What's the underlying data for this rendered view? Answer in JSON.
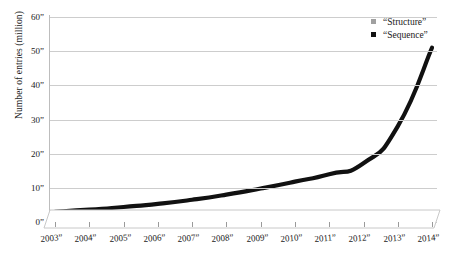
{
  "chart_data": {
    "type": "line",
    "title": "",
    "xlabel": "",
    "ylabel": "Number of entries (million)",
    "categories": [
      "2003”",
      "2004”",
      "2005”",
      "2006”",
      "2007”",
      "2008”",
      "2009”",
      "2010”",
      "2011”",
      "2012”",
      "2013”",
      "2014”"
    ],
    "x_tick_labels": [
      "2003”",
      "2004”",
      "2005”",
      "2006”",
      "2007”",
      "2008”",
      "2009”",
      "2010”",
      "2011”",
      "2012”",
      "2013”",
      "2014”"
    ],
    "y_tick_labels": [
      "0”",
      "10”",
      "20”",
      "30”",
      "40”",
      "50”",
      "60”"
    ],
    "y_tick_values": [
      0,
      10,
      20,
      30,
      40,
      50,
      60
    ],
    "ylim": [
      0,
      60
    ],
    "grid": "horizontal",
    "legend_position": "top-right",
    "series": [
      {
        "name": "“Structure”",
        "color": "#a0a0a0",
        "values": [
          0.1,
          0.12,
          0.15,
          0.18,
          0.22,
          0.26,
          0.3,
          0.35,
          0.4,
          0.45,
          0.5,
          0.55
        ]
      },
      {
        "name": "“Sequence”",
        "color": "#111111",
        "values": [
          3.0,
          3.6,
          4.4,
          5.3,
          6.5,
          8.0,
          9.8,
          11.8,
          14.0,
          17.2,
          28.0,
          51.0
        ]
      }
    ]
  },
  "axes": {
    "y_title": "Number of entries (million)"
  },
  "legend": {
    "items": [
      {
        "label": "“Structure”",
        "color": "#a0a0a0",
        "marker": "square-marker"
      },
      {
        "label": "“Sequence”",
        "color": "#111111",
        "marker": "square-marker"
      }
    ]
  },
  "colors": {
    "background": "#ffffff",
    "gridline": "#cdcdcd",
    "axis": "#bdbdbd",
    "structure": "#a0a0a0",
    "sequence": "#111111",
    "text": "#1a1a1a"
  }
}
